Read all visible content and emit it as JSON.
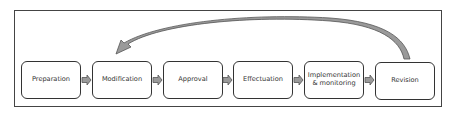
{
  "diagram": {
    "type": "process-flow",
    "steps": [
      {
        "label": "Preparation"
      },
      {
        "label": "Modification"
      },
      {
        "label": "Approval"
      },
      {
        "label": "Effectuation"
      },
      {
        "label": "Implementation & monitoring"
      },
      {
        "label": "Revision"
      }
    ],
    "feedback_arrow": {
      "from": "Revision",
      "to": "Modification"
    },
    "colors": {
      "border": "#333333",
      "arrow_fill": "#9a9a9a",
      "arrow_stroke": "#555555",
      "background": "#ffffff"
    }
  }
}
